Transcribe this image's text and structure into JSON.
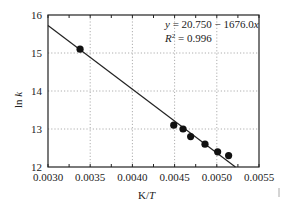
{
  "chart_data": {
    "type": "scatter",
    "title": "",
    "xlabel": "K/T",
    "ylabel": "ln k",
    "xlim": [
      0.003,
      0.0055
    ],
    "ylim": [
      12,
      16
    ],
    "grid": true,
    "x_ticks": [
      "0.0030",
      "0.0035",
      "0.0040",
      "0.0045",
      "0.0050",
      "0.0055"
    ],
    "y_ticks": [
      "12",
      "13",
      "14",
      "15",
      "16"
    ],
    "series": [
      {
        "name": "data",
        "x": [
          0.00338,
          0.00449,
          0.0046,
          0.00469,
          0.00486,
          0.00501,
          0.00514
        ],
        "y": [
          15.1,
          13.1,
          13.0,
          12.8,
          12.6,
          12.4,
          12.3
        ]
      }
    ],
    "fit": {
      "intercept": 20.75,
      "slope": -1676.0
    },
    "annotations": [
      "y = 20.750 − 1676.0x",
      "R² = 0.996"
    ],
    "legend": "none"
  },
  "labels": {
    "xlabel_main": "K/",
    "xlabel_italic": "T",
    "ylabel_main": "ln ",
    "ylabel_italic": "k",
    "eq_y": "y",
    "eq_rest": " = 20.750 − 1676.0",
    "eq_x": "x",
    "r2_R": "R",
    "r2_sup": "2",
    "r2_rest": " = 0.996"
  }
}
